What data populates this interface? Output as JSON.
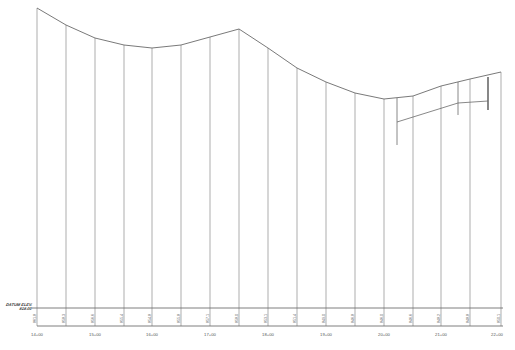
{
  "drawing": {
    "type": "profile",
    "datum": {
      "label": "DATUM ELEV.",
      "value": "818.00"
    },
    "baseline_y": 308,
    "plot_left_x": 37,
    "plot_right_x": 497,
    "line_color": "#808080",
    "text_color": "#555555"
  },
  "stations": [
    {
      "label": "14+00",
      "x": 37
    },
    {
      "label": "15+00",
      "x": 95
    },
    {
      "label": "16+00",
      "x": 152
    },
    {
      "label": "17+00",
      "x": 210
    },
    {
      "label": "18+00",
      "x": 268
    },
    {
      "label": "19+00",
      "x": 326
    },
    {
      "label": "20+00",
      "x": 384
    },
    {
      "label": "21+00",
      "x": 441
    },
    {
      "label": "22+00",
      "x": 497
    }
  ],
  "ordinates": [
    {
      "x": 37,
      "top_y": 8,
      "elev": "861.8"
    },
    {
      "x": 66,
      "top_y": 25,
      "elev": "858.3"
    },
    {
      "x": 95,
      "top_y": 38,
      "elev": "856.6"
    },
    {
      "x": 124,
      "top_y": 45,
      "elev": "855.4"
    },
    {
      "x": 152,
      "top_y": 48,
      "elev": "854.8"
    },
    {
      "x": 181,
      "top_y": 45,
      "elev": "855.8"
    },
    {
      "x": 210,
      "top_y": 37,
      "elev": "857.1"
    },
    {
      "x": 239,
      "top_y": 29,
      "elev": "858.0"
    },
    {
      "x": 268,
      "top_y": 48,
      "elev": "853.1"
    },
    {
      "x": 297,
      "top_y": 68,
      "elev": "851.4"
    },
    {
      "x": 326,
      "top_y": 82,
      "elev": "849.0"
    },
    {
      "x": 355,
      "top_y": 93,
      "elev": "846.8"
    },
    {
      "x": 384,
      "top_y": 99,
      "elev": "846.0"
    },
    {
      "x": 413,
      "top_y": 96,
      "elev": "846.6"
    },
    {
      "x": 441,
      "top_y": 86,
      "elev": "848.2"
    },
    {
      "x": 470,
      "top_y": 79,
      "elev": "848.8"
    },
    {
      "x": 501,
      "top_y": 72,
      "elev": "850.1"
    }
  ],
  "secondary_profile": {
    "points": [
      [
        397,
        122
      ],
      [
        458,
        103
      ],
      [
        488,
        101
      ]
    ],
    "drops": [
      {
        "x": 397,
        "y1": 98,
        "y2": 145
      },
      {
        "x": 458,
        "y1": 82,
        "y2": 115
      },
      {
        "x": 488,
        "y1": 77,
        "y2": 110
      }
    ]
  }
}
